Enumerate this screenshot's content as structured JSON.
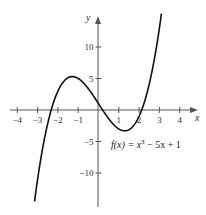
{
  "chart_data": {
    "type": "line",
    "title": "",
    "function_label": "f(x) = x³ − 5x + 1",
    "function_label_parts": {
      "fx": "f(x)",
      "eq": " = x",
      "exp": "3",
      "rest": " − 5x + 1"
    },
    "xlabel": "x",
    "ylabel": "y",
    "xlim": [
      -4.5,
      4.7
    ],
    "ylim": [
      -15,
      15
    ],
    "grid": false,
    "x_ticks": [
      -4,
      -3,
      -2,
      -1,
      1,
      2,
      3,
      4
    ],
    "x_tick_labels": [
      "−4",
      "−3",
      "−2",
      "−1",
      "1",
      "2",
      "3",
      "4"
    ],
    "y_ticks": [
      10,
      5,
      -5,
      -10
    ],
    "y_tick_labels": [
      "10",
      "5",
      "−5",
      "−10"
    ],
    "series": [
      {
        "name": "f(x) = x^3 - 5x + 1",
        "x": [
          -3.15,
          -3.0,
          -2.5,
          -2.0,
          -1.5,
          -1.29,
          -1.0,
          -0.5,
          0.0,
          0.5,
          1.0,
          1.29,
          1.5,
          2.0,
          2.5,
          3.0,
          3.1
        ],
        "values": [
          -14.5,
          -11.0,
          -2.1,
          3.0,
          5.1,
          5.3,
          5.0,
          3.4,
          1.0,
          -1.4,
          -3.0,
          -3.3,
          -3.1,
          -1.0,
          3.1,
          13.0,
          15.3
        ]
      }
    ]
  }
}
